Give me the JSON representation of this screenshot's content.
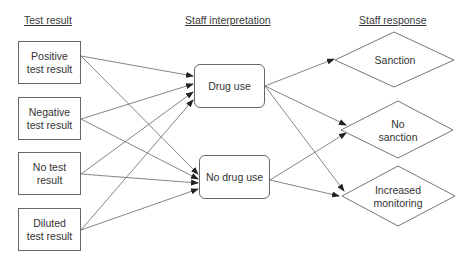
{
  "columns": {
    "test_result": "Test result",
    "staff_interpretation": "Staff interpretation",
    "staff_response": "Staff response"
  },
  "test_results": [
    {
      "id": "positive",
      "label": "Positive\ntest result"
    },
    {
      "id": "negative",
      "label": "Negative\ntest result"
    },
    {
      "id": "no_test",
      "label": "No test\nresult"
    },
    {
      "id": "diluted",
      "label": "Diluted\ntest result"
    }
  ],
  "interpretations": [
    {
      "id": "drug_use",
      "label": "Drug use"
    },
    {
      "id": "no_drug_use",
      "label": "No drug use"
    }
  ],
  "responses": [
    {
      "id": "sanction",
      "label": "Sanction"
    },
    {
      "id": "no_sanction",
      "label": "No\nsanction"
    },
    {
      "id": "increased_monitoring",
      "label": "Increased\nmonitoring"
    }
  ],
  "edges": [
    {
      "from": "positive",
      "to": "drug_use"
    },
    {
      "from": "positive",
      "to": "no_drug_use"
    },
    {
      "from": "negative",
      "to": "drug_use"
    },
    {
      "from": "negative",
      "to": "no_drug_use"
    },
    {
      "from": "no_test",
      "to": "drug_use"
    },
    {
      "from": "no_test",
      "to": "no_drug_use"
    },
    {
      "from": "diluted",
      "to": "drug_use"
    },
    {
      "from": "diluted",
      "to": "no_drug_use"
    },
    {
      "from": "drug_use",
      "to": "sanction"
    },
    {
      "from": "drug_use",
      "to": "no_sanction"
    },
    {
      "from": "drug_use",
      "to": "increased_monitoring"
    },
    {
      "from": "no_drug_use",
      "to": "no_sanction"
    },
    {
      "from": "no_drug_use",
      "to": "increased_monitoring"
    }
  ],
  "colors": {
    "stroke": "#666666",
    "text": "#333333",
    "background": "#ffffff"
  }
}
